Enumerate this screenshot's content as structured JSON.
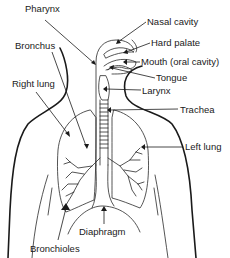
{
  "diagram": {
    "colors": {
      "line": "#1a1a1a",
      "background": "#ffffff"
    },
    "labels": [
      {
        "id": "pharynx",
        "text": "Pharynx",
        "x": 25,
        "y": 10
      },
      {
        "id": "nasal_cavity",
        "text": "Nasal cavity",
        "x": 147,
        "y": 17
      },
      {
        "id": "hard_palate",
        "text": "Hard palate",
        "x": 151,
        "y": 38
      },
      {
        "id": "bronchus",
        "text": "Bronchus",
        "x": 15,
        "y": 41
      },
      {
        "id": "mouth",
        "text": "Mouth (oral cavity)",
        "x": 141,
        "y": 57
      },
      {
        "id": "tongue",
        "text": "Tongue",
        "x": 156,
        "y": 73
      },
      {
        "id": "right_lung",
        "text": "Right lung",
        "x": 12,
        "y": 79
      },
      {
        "id": "larynx",
        "text": "Larynx",
        "x": 142,
        "y": 86
      },
      {
        "id": "trachea",
        "text": "Trachea",
        "x": 180,
        "y": 105
      },
      {
        "id": "left_lung",
        "text": "Left lung",
        "x": 185,
        "y": 142
      },
      {
        "id": "diaphragm",
        "text": "Diaphragm",
        "x": 79,
        "y": 227
      },
      {
        "id": "bronchioles",
        "text": "Bronchioles",
        "x": 30,
        "y": 244
      }
    ]
  }
}
